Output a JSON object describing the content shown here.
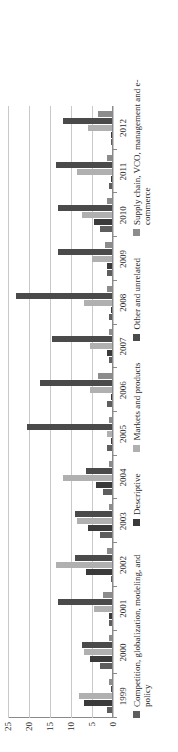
{
  "chart_data": {
    "type": "bar",
    "orientation": "vertical",
    "title": "",
    "xlabel": "",
    "ylabel": "",
    "ylim": [
      0,
      25
    ],
    "yticks": [
      0,
      5,
      10,
      15,
      20,
      25
    ],
    "ytick_labels": [
      "0",
      "5",
      "10",
      "15",
      "20",
      "25"
    ],
    "grid": true,
    "legend_position": "bottom",
    "categories": [
      "1999",
      "2000",
      "2001",
      "2002",
      "2003",
      "2004",
      "2005",
      "2006",
      "2007",
      "2008",
      "2009",
      "2010",
      "2011",
      "2012"
    ],
    "series": [
      {
        "name": "Competition, globalization, modeling, and policy",
        "color": "#5e5e5e",
        "values": [
          1.5,
          3.0,
          1.0,
          0.5,
          3.0,
          2.5,
          1.5,
          1.5,
          1.0,
          1.0,
          1.5,
          3.0,
          1.0,
          0.5
        ]
      },
      {
        "name": "Descriptive",
        "color": "#3a3a3a",
        "values": [
          7.0,
          5.5,
          1.0,
          6.5,
          6.0,
          4.0,
          0.5,
          0.5,
          1.5,
          0.5,
          1.5,
          4.5,
          0.5,
          0.5
        ]
      },
      {
        "name": "Markets and products",
        "color": "#b0b0b0",
        "values": [
          8.0,
          7.0,
          4.5,
          13.5,
          8.5,
          12.0,
          1.5,
          5.5,
          5.5,
          7.0,
          5.0,
          7.5,
          8.5,
          6.0
        ]
      },
      {
        "name": "Other and unrelated",
        "color": "#4a4a4a",
        "values": [
          0.5,
          7.5,
          13.0,
          9.0,
          9.0,
          6.5,
          20.5,
          17.5,
          14.5,
          23.0,
          13.0,
          13.0,
          13.5,
          12.0
        ]
      },
      {
        "name": "Supply chain, VCO, management and e-commerce",
        "color": "#8c8c8c",
        "values": [
          1.0,
          1.0,
          2.5,
          1.5,
          1.0,
          1.0,
          1.0,
          3.5,
          1.0,
          1.5,
          2.0,
          1.5,
          1.5,
          3.5
        ]
      }
    ]
  }
}
